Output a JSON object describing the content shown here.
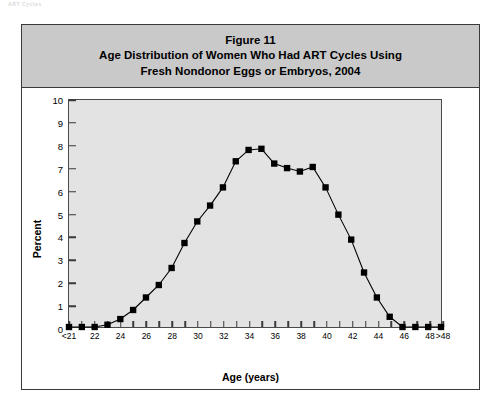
{
  "page": {
    "header_fragment": "ART Cycles"
  },
  "figure": {
    "title_lines": [
      "Figure 11",
      "Age Distribution of Women Who Had ART Cycles Using",
      "Fresh Nondonor Eggs or Embryos, 2004"
    ],
    "title_line_1": "Figure 11",
    "title_line_2": "Age Distribution of Women Who Had ART Cycles Using",
    "title_line_3": "Fresh Nondonor Eggs or Embryos, 2004",
    "colors": {
      "title_band": "#c9c9c9",
      "plot_background": "#e3e3e3",
      "frame_border": "#3a3a3a",
      "series_line": "#000000",
      "series_marker": "#000000"
    }
  },
  "chart_data": {
    "type": "line",
    "xlabel": "Age (years)",
    "ylabel": "Percent",
    "grid": false,
    "legend": "none",
    "marker": "filled-square",
    "ylim": [
      0,
      10
    ],
    "yticks": [
      0,
      1,
      2,
      3,
      4,
      5,
      6,
      7,
      8,
      9,
      10
    ],
    "ytick_labels": [
      "0",
      "1",
      "2",
      "3",
      "4",
      "5",
      "6",
      "7",
      "8",
      "9",
      "10"
    ],
    "x": [
      20,
      21,
      22,
      23,
      24,
      25,
      26,
      27,
      28,
      29,
      30,
      31,
      32,
      33,
      34,
      35,
      36,
      37,
      38,
      39,
      40,
      41,
      42,
      43,
      44,
      45,
      46,
      47,
      48,
      49
    ],
    "categories": [
      "<21",
      "21",
      "22",
      "23",
      "24",
      "25",
      "26",
      "27",
      "28",
      "29",
      "30",
      "31",
      "32",
      "33",
      "34",
      "35",
      "36",
      "37",
      "38",
      "39",
      "40",
      "41",
      "42",
      "43",
      "44",
      "45",
      "46",
      "47",
      "48",
      ">48"
    ],
    "xtick_labels": [
      "<21",
      "",
      "22",
      "",
      "24",
      "",
      "26",
      "",
      "28",
      "",
      "30",
      "",
      "32",
      "",
      "34",
      "",
      "36",
      "",
      "38",
      "",
      "40",
      "",
      "42",
      "",
      "44",
      "",
      "46",
      "",
      "48",
      ">48"
    ],
    "values": [
      0.0,
      0.0,
      0.0,
      0.1,
      0.35,
      0.75,
      1.3,
      1.85,
      2.6,
      3.7,
      4.65,
      5.35,
      6.15,
      7.3,
      7.8,
      7.85,
      7.2,
      7.0,
      6.85,
      7.05,
      6.15,
      4.95,
      3.85,
      2.4,
      1.3,
      0.45,
      0.0,
      0.0,
      0.0,
      0.0
    ],
    "series": [
      {
        "name": "Percent of ART cycles",
        "values": [
          0.0,
          0.0,
          0.0,
          0.1,
          0.35,
          0.75,
          1.3,
          1.85,
          2.6,
          3.7,
          4.65,
          5.35,
          6.15,
          7.3,
          7.8,
          7.85,
          7.2,
          7.0,
          6.85,
          7.05,
          6.15,
          4.95,
          3.85,
          2.4,
          1.3,
          0.45,
          0.0,
          0.0,
          0.0,
          0.0
        ]
      }
    ]
  }
}
